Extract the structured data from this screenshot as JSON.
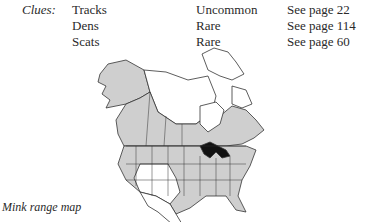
{
  "clues": {
    "label": "Clues:",
    "rows": [
      {
        "name": "Tracks",
        "frequency": "Uncommon",
        "page": "See page 22"
      },
      {
        "name": "Dens",
        "frequency": "Rare",
        "page": "See page 114"
      },
      {
        "name": "Scats",
        "frequency": "Rare",
        "page": "See page 60"
      }
    ]
  },
  "map": {
    "range_color": "#cfcfcf",
    "outside_color": "#ffffff",
    "water_color": "#111111",
    "line_color": "#333333"
  },
  "caption": "Mink range map"
}
